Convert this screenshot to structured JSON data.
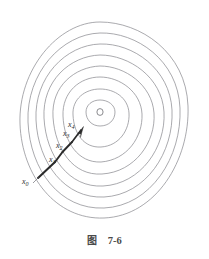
{
  "figure": {
    "caption_label": "图",
    "caption_number": "7-6",
    "origin_marker": "O",
    "background_color": "#ffffff",
    "contour_color": "#8d8d93",
    "path_color": "#2b2b2b",
    "label_color": "#2e2e2e"
  },
  "contours": {
    "count": 8,
    "center": {
      "x": 100,
      "y": 112
    },
    "description": "concentric closed level-set ovals",
    "rings": [
      {
        "index": 1,
        "rx": 15,
        "ry": 12
      },
      {
        "index": 2,
        "rx": 27,
        "ry": 23
      },
      {
        "index": 3,
        "rx": 40,
        "ry": 35
      },
      {
        "index": 4,
        "rx": 52,
        "ry": 46
      },
      {
        "index": 5,
        "rx": 63,
        "ry": 57
      },
      {
        "index": 6,
        "rx": 72,
        "ry": 68
      },
      {
        "index": 7,
        "rx": 80,
        "ry": 79
      },
      {
        "index": 8,
        "rx": 86,
        "ry": 90
      }
    ]
  },
  "path": {
    "description": "zigzag descent path converging to the center",
    "arrow_head": true,
    "points": [
      {
        "name": "x0",
        "x": 38,
        "y": 178
      },
      {
        "name": "x1",
        "x": 55,
        "y": 162
      },
      {
        "name": "x2",
        "x": 62,
        "y": 152
      },
      {
        "name": "x3",
        "x": 72,
        "y": 142
      },
      {
        "name": "x4",
        "x": 81,
        "y": 131
      }
    ]
  },
  "labels": [
    {
      "id": "x0",
      "text": "x",
      "sub": "0",
      "x": 24,
      "y": 182
    },
    {
      "id": "x1",
      "text": "x",
      "sub": "1",
      "x": 51,
      "y": 160
    },
    {
      "id": "x2",
      "text": "x",
      "sub": "2",
      "x": 58,
      "y": 146
    },
    {
      "id": "x3",
      "text": "x",
      "sub": "3",
      "x": 64,
      "y": 133
    },
    {
      "id": "x4",
      "text": "x",
      "sub": "4",
      "x": 68,
      "y": 125
    }
  ]
}
